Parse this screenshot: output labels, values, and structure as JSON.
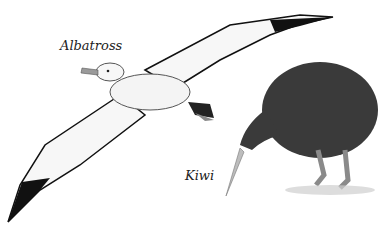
{
  "labels": {
    "albatross": "Albatross",
    "kiwi": "Kiwi"
  },
  "colors": {
    "background": "#ffffff",
    "albatross_body": "#f4f4f4",
    "albatross_wingtip": "#111111",
    "albatross_beak": "#9a9a9a",
    "kiwi_body": "#3a3a3a",
    "kiwi_legs": "#8a8a8a"
  }
}
